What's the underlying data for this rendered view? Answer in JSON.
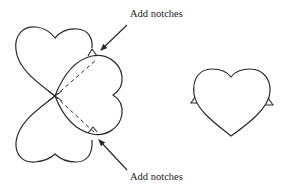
{
  "diagram": {
    "type": "illustration",
    "labels": {
      "top": "Add notches",
      "bottom": "Add notches"
    },
    "colors": {
      "stroke": "#2a2a2a",
      "background": "#ffffff"
    },
    "elements": [
      {
        "id": "heart-upper-left",
        "orientation": "upright"
      },
      {
        "id": "heart-middle",
        "orientation": "rotated-left",
        "notches": 2,
        "fold_lines": "dashed"
      },
      {
        "id": "heart-lower-left",
        "orientation": "inverted"
      },
      {
        "id": "heart-right",
        "orientation": "upright",
        "notches": 2
      }
    ]
  }
}
